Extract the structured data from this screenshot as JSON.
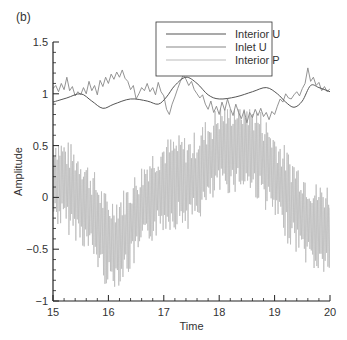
{
  "panel_label": "(b)",
  "chart_data": {
    "type": "line",
    "title": "",
    "xlabel": "Time",
    "ylabel": "Amplitude",
    "xlim": [
      15,
      20
    ],
    "ylim": [
      -1,
      1.5
    ],
    "xticks": [
      15,
      16,
      17,
      18,
      19,
      20
    ],
    "xtick_labels": [
      "15",
      "16",
      "17",
      "18",
      "19",
      "20"
    ],
    "yticks": [
      -1,
      -0.5,
      0,
      0.5,
      1,
      1.5
    ],
    "ytick_labels": [
      "−1",
      "−0.5",
      "0",
      "0.5",
      "1",
      "1.5"
    ],
    "x_minor_step": 0.2,
    "y_minor_step": 0.1,
    "grid": false,
    "legend": {
      "placement": "top-center",
      "entries": [
        "Interior U",
        "Inlet U",
        "Interior P"
      ]
    },
    "series": [
      {
        "name": "Interior U",
        "color": "#555555",
        "x": [
          15.0,
          15.25,
          15.5,
          15.7,
          15.9,
          16.1,
          16.4,
          16.7,
          16.9,
          17.05,
          17.2,
          17.4,
          17.6,
          17.8,
          18.0,
          18.3,
          18.6,
          18.85,
          19.05,
          19.2,
          19.35,
          19.5,
          19.65,
          19.8,
          20.0
        ],
        "y": [
          0.92,
          0.96,
          1.0,
          0.93,
          0.86,
          0.9,
          0.95,
          0.93,
          0.9,
          0.97,
          1.08,
          1.16,
          1.1,
          0.99,
          0.95,
          0.97,
          1.02,
          1.06,
          1.0,
          0.92,
          0.87,
          0.93,
          1.08,
          1.06,
          1.02
        ]
      },
      {
        "name": "Inlet U",
        "color": "#888888",
        "x": [
          15.0,
          15.05,
          15.1,
          15.15,
          15.2,
          15.25,
          15.3,
          15.35,
          15.4,
          15.45,
          15.5,
          15.55,
          15.6,
          15.65,
          15.7,
          15.75,
          15.8,
          15.85,
          15.9,
          15.95,
          16.0,
          16.05,
          16.1,
          16.15,
          16.2,
          16.25,
          16.3,
          16.35,
          16.4,
          16.45,
          16.5,
          16.55,
          16.6,
          16.65,
          16.7,
          16.75,
          16.8,
          16.85,
          16.9,
          16.95,
          17.0,
          17.05,
          17.1,
          17.15,
          17.2,
          17.25,
          17.3,
          17.35,
          17.4,
          17.45,
          17.5,
          17.55,
          17.6,
          17.65,
          17.7,
          17.75,
          17.8,
          17.85,
          17.9,
          17.95,
          18.0,
          18.05,
          18.1,
          18.15,
          18.2,
          18.25,
          18.3,
          18.35,
          18.4,
          18.45,
          18.5,
          18.55,
          18.6,
          18.65,
          18.7,
          18.75,
          18.8,
          18.85,
          18.9,
          18.95,
          19.0,
          19.05,
          19.1,
          19.15,
          19.2,
          19.25,
          19.3,
          19.35,
          19.4,
          19.45,
          19.5,
          19.55,
          19.6,
          19.65,
          19.7,
          19.75,
          19.8,
          19.85,
          19.9,
          19.95,
          20.0
        ],
        "y": [
          1.05,
          1.08,
          1.02,
          1.1,
          1.04,
          1.16,
          1.03,
          1.07,
          0.98,
          1.02,
          0.99,
          1.06,
          1.0,
          1.12,
          1.03,
          1.08,
          0.99,
          1.13,
          1.07,
          1.16,
          1.1,
          1.19,
          1.14,
          1.21,
          1.16,
          1.23,
          1.15,
          1.12,
          1.04,
          1.08,
          0.95,
          1.0,
          1.06,
          1.03,
          1.1,
          1.02,
          1.06,
          0.99,
          1.11,
          1.02,
          0.98,
          0.85,
          0.8,
          0.9,
          0.97,
          1.05,
          1.12,
          1.18,
          1.14,
          1.08,
          1.12,
          1.04,
          1.0,
          0.96,
          0.99,
          0.9,
          0.85,
          0.93,
          0.82,
          0.88,
          0.8,
          0.92,
          0.84,
          0.95,
          0.86,
          0.79,
          0.9,
          0.82,
          0.76,
          0.84,
          0.72,
          0.82,
          0.77,
          0.85,
          0.79,
          0.86,
          0.78,
          0.82,
          0.75,
          0.83,
          0.8,
          0.88,
          0.95,
          0.92,
          1.0,
          0.96,
          0.95,
          0.99,
          1.02,
          0.98,
          1.05,
          1.1,
          1.25,
          1.12,
          1.16,
          1.08,
          1.11,
          1.03,
          1.07,
          1.02,
          1.05
        ]
      },
      {
        "name": "Interior P",
        "color": "#bbbbbb",
        "envelope_x": [
          15.0,
          15.25,
          15.5,
          15.75,
          16.0,
          16.25,
          16.5,
          16.75,
          17.0,
          17.25,
          17.5,
          17.75,
          18.0,
          18.25,
          18.5,
          18.75,
          19.0,
          19.25,
          19.5,
          19.75,
          20.0
        ],
        "envelope_center": [
          0.2,
          0.1,
          0.0,
          -0.2,
          -0.45,
          -0.38,
          -0.2,
          0.0,
          0.12,
          0.15,
          0.15,
          0.3,
          0.45,
          0.5,
          0.5,
          0.4,
          0.2,
          0.0,
          -0.15,
          -0.3,
          -0.3
        ],
        "oscillation_amplitude": 0.38,
        "oscillation_cycles_per_time_unit": 40,
        "range": [
          -0.95,
          0.85
        ]
      }
    ]
  }
}
